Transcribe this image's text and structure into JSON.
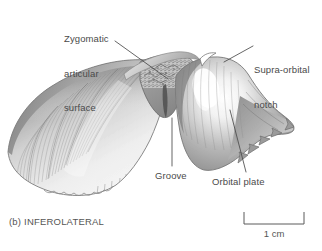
{
  "figure": {
    "panel_caption": "(b) INFEROLATERAL",
    "view": "inferolateral",
    "style": "grayscale-pencil-illustration",
    "background_color": "#ffffff",
    "line_color": "#4a4a4a",
    "text_color": "#4a4a4a"
  },
  "labels": {
    "zygomatic": {
      "line1": "Zygomatic",
      "line2": "articular",
      "line3": "surface"
    },
    "supraorbital": {
      "line1": "Supra-orbital",
      "line2": "notch"
    },
    "groove": "Groove",
    "orbital_plate": "Orbital plate"
  },
  "scale_bar": {
    "value": "1 cm",
    "length_px": 60
  }
}
